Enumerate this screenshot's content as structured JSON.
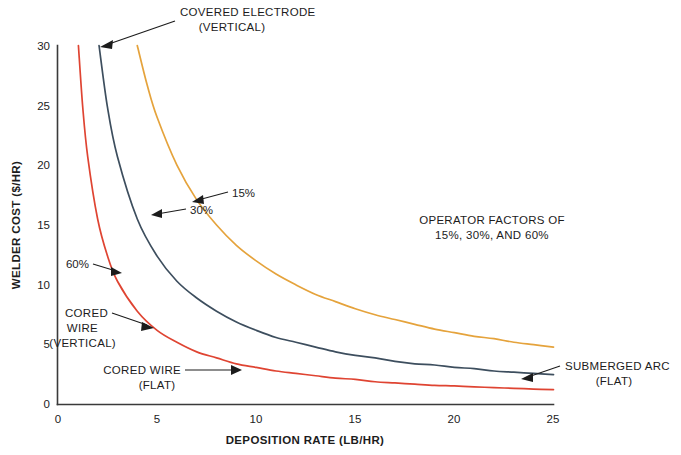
{
  "chart_data": {
    "type": "line",
    "title": "",
    "xlabel": "DEPOSITION RATE (LB/HR)",
    "ylabel": "WELDER COST ($/HR)",
    "xlim": [
      0,
      25
    ],
    "ylim": [
      0,
      30
    ],
    "xticks": [
      "0",
      "5",
      "10",
      "15",
      "20",
      "25"
    ],
    "yticks": [
      "0",
      "5",
      "10",
      "15",
      "20",
      "25",
      "30"
    ],
    "grid": false,
    "legend_position": "inline-annotations",
    "note": {
      "line1": "OPERATOR FACTORS OF",
      "line2": "15%, 30%, AND 60%"
    },
    "series": [
      {
        "name": "15% operator factor",
        "label": "15%",
        "curve_label_line1": "COVERED ELECTRODE",
        "curve_label_line2": "(VERTICAL)",
        "color": "#e5a33c",
        "constant_k": 120,
        "x": [
          4.0,
          4.5,
          5,
          6,
          7,
          8,
          9,
          10,
          11,
          12,
          13,
          14,
          15,
          16,
          17,
          18,
          19,
          20,
          21,
          22,
          23,
          24,
          25
        ],
        "y": [
          30.0,
          26.7,
          24.0,
          20.0,
          17.1,
          15.0,
          13.3,
          12.0,
          10.9,
          10.0,
          9.2,
          8.6,
          8.0,
          7.5,
          7.1,
          6.7,
          6.3,
          6.0,
          5.7,
          5.5,
          5.2,
          5.0,
          4.8
        ]
      },
      {
        "name": "30% operator factor",
        "label": "30%",
        "curve_label_line1": "SUBMERGED ARC",
        "curve_label_line2": "(FLAT)",
        "color": "#3d4e5e",
        "constant_k": 62,
        "x": [
          2.07,
          2.5,
          3,
          4,
          5,
          6,
          7,
          8,
          9,
          10,
          11,
          12,
          13,
          14,
          15,
          16,
          17,
          18,
          19,
          20,
          21,
          22,
          23,
          24,
          25
        ],
        "y": [
          30.0,
          24.8,
          20.7,
          15.5,
          12.4,
          10.3,
          8.9,
          7.8,
          6.9,
          6.2,
          5.6,
          5.2,
          4.8,
          4.4,
          4.1,
          3.9,
          3.6,
          3.4,
          3.3,
          3.1,
          3.0,
          2.8,
          2.7,
          2.6,
          2.5
        ]
      },
      {
        "name": "60% operator factor",
        "label": "60%",
        "curve_label_line1": "CORED WIRE",
        "curve_label_line2": "(FLAT)",
        "curve_label_alt_line1": "CORED",
        "curve_label_alt_line2": "WIRE",
        "curve_label_alt_line3": "(VERTICAL)",
        "color": "#df4432",
        "constant_k": 31,
        "x": [
          1.03,
          1.25,
          1.5,
          2,
          2.5,
          3,
          4,
          5,
          6,
          7,
          8,
          9,
          10,
          11,
          12,
          13,
          14,
          15,
          16,
          17,
          18,
          19,
          20,
          21,
          22,
          23,
          24,
          25
        ],
        "y": [
          30.0,
          24.8,
          20.7,
          15.5,
          12.4,
          10.3,
          7.8,
          6.2,
          5.2,
          4.4,
          3.9,
          3.4,
          3.1,
          2.8,
          2.6,
          2.4,
          2.2,
          2.1,
          1.9,
          1.8,
          1.7,
          1.6,
          1.55,
          1.48,
          1.41,
          1.35,
          1.29,
          1.24
        ]
      }
    ],
    "annotations": [
      {
        "id": "covered-electrode",
        "text_line1": "COVERED ELECTRODE",
        "text_line2": "(VERTICAL)"
      },
      {
        "id": "pct-15",
        "text": "15%"
      },
      {
        "id": "pct-30",
        "text": "30%"
      },
      {
        "id": "pct-60",
        "text": "60%"
      },
      {
        "id": "cored-wire-vertical",
        "text_line1": "CORED",
        "text_line2": "WIRE",
        "text_line3": "(VERTICAL)"
      },
      {
        "id": "cored-wire-flat",
        "text_line1": "CORED WIRE",
        "text_line2": "(FLAT)"
      },
      {
        "id": "submerged-arc-flat",
        "text_line1": "SUBMERGED ARC",
        "text_line2": "(FLAT)"
      }
    ]
  }
}
